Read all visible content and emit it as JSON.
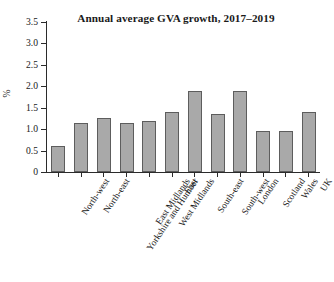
{
  "chart_data": {
    "type": "bar",
    "title": "Annual average GVA growth, 2017–2019",
    "xlabel": "",
    "ylabel": "%",
    "ylim": [
      0,
      3.5
    ],
    "ytick_labels": [
      "3.5",
      "3.0",
      "2.5",
      "2.0",
      "1.5",
      "1.0",
      "0.5",
      "0"
    ],
    "ytick_values": [
      3.5,
      3.0,
      2.5,
      2.0,
      1.5,
      1.0,
      0.5,
      0
    ],
    "grid": false,
    "legend": "none",
    "bar_color": "#a9a9a9",
    "bar_border_color": "#5d5d5d",
    "axis_color": "#2b2b2b",
    "categories": [
      "North-west",
      "North-east",
      "Yorkshire and Humber",
      "East Midlands",
      "West Midlands",
      "East",
      "South-east",
      "South-west",
      "London",
      "Scotland",
      "Wales",
      "UK"
    ],
    "values": [
      0.6,
      1.15,
      1.25,
      1.15,
      1.2,
      1.4,
      1.9,
      1.35,
      1.9,
      0.95,
      0.95,
      1.4
    ]
  }
}
